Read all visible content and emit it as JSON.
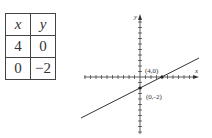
{
  "table": {
    "headers": [
      "x",
      "y"
    ],
    "rows": [
      [
        "4",
        "0"
      ],
      [
        "0",
        "−2"
      ]
    ]
  },
  "graph": {
    "x_axis_label": "x",
    "y_axis_label": "y",
    "points": [
      {
        "label": "(4,0)",
        "x": 4,
        "y": 0
      },
      {
        "label": "(0,-2)",
        "x": 0,
        "y": -2
      }
    ],
    "line_equation": "y = x/2 - 2",
    "line_color": "#333333"
  }
}
